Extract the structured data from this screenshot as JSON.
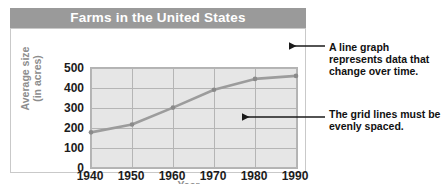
{
  "chart_data": {
    "type": "line",
    "title": "Farms in the United States",
    "xlabel": "Year",
    "ylabel": "Average size (in acres)",
    "ylabel_line1": "Average size",
    "ylabel_line2": "(in acres)",
    "categories": [
      1940,
      1950,
      1960,
      1970,
      1980,
      1990
    ],
    "x_tick_labels": [
      "1940",
      "1950",
      "1960",
      "1970",
      "1980",
      "1990"
    ],
    "y_tick_labels": [
      "500",
      "400",
      "300",
      "200",
      "100",
      "0"
    ],
    "y_ticks": [
      500,
      400,
      300,
      200,
      100,
      0
    ],
    "values": [
      175,
      215,
      300,
      390,
      445,
      460
    ],
    "series": [
      {
        "name": "Average farm size",
        "values": [
          175,
          215,
          300,
          390,
          445,
          460
        ]
      }
    ],
    "xlim": [
      1940,
      1990
    ],
    "ylim": [
      0,
      500
    ],
    "grid": true,
    "legend": "none",
    "colors": {
      "line": "#9c9c9c",
      "marker": "#8a8a8a",
      "plot_background": "#e6e6e6",
      "grid": "#b5b5b5",
      "title_banner": "#9a9a9a",
      "title_text": "#ffffff",
      "axis_label_text": "#8d8d8d",
      "tick_text": "#1c1c1c",
      "annotation_text": "#111111"
    }
  },
  "annotations": [
    {
      "id": "line-graph-note",
      "text": "A line graph represents data that change over time."
    },
    {
      "id": "grid-lines-note",
      "text": "The grid lines must be evenly spaced."
    }
  ]
}
